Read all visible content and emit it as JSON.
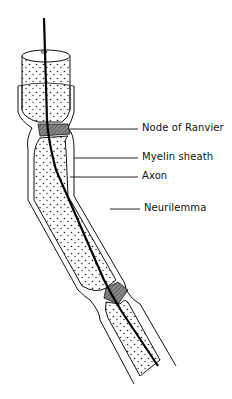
{
  "figure": {
    "labels": [
      {
        "id": "node",
        "text": "Node of Ranvier"
      },
      {
        "id": "myelin",
        "text": "Myelin sheath"
      },
      {
        "id": "axon",
        "text": "Axon"
      },
      {
        "id": "neurilemma",
        "text": "Neurilemma"
      }
    ]
  },
  "colors": {
    "ink": "#111111",
    "background": "#ffffff",
    "node_fill": "#6a6a6a"
  }
}
